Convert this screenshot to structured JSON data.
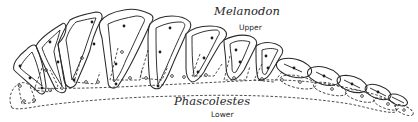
{
  "figure": {
    "type": "dental occlusion diagram",
    "upper": {
      "genus": "Melanodon",
      "jaw_label": "Upper",
      "outline_style": "solid",
      "tooth_count": 13
    },
    "lower": {
      "genus": "Phascolestes",
      "jaw_label": "Lower",
      "outline_style": "dashed",
      "tooth_count": 13
    },
    "colors": {
      "background": "#ffffff",
      "ink": "#2a2a2a"
    }
  }
}
